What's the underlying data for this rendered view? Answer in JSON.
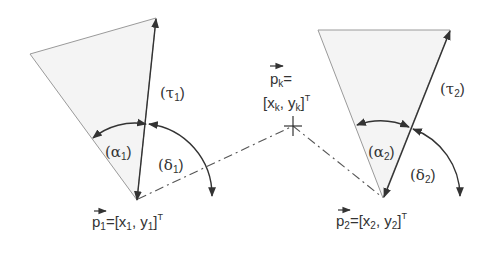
{
  "colors": {
    "stroke": "#333333",
    "fill": "#f4f4f4",
    "edge": "#9a9a9a",
    "background": "#ffffff"
  },
  "left_sensor": {
    "tau_label": "(τ",
    "tau_sub": "1",
    "alpha_label": "(α",
    "alpha_sub": "1",
    "delta_label": "(δ",
    "delta_sub": "1",
    "close_paren": ")",
    "point_label_p": "p",
    "point_sub": "1",
    "point_eq": "=[x",
    "point_x_sub": "1",
    "point_comma": ", y",
    "point_y_sub": "1",
    "point_close": "]",
    "point_sup": "T"
  },
  "right_sensor": {
    "tau_label": "(τ",
    "tau_sub": "2",
    "alpha_label": "(α",
    "alpha_sub": "2",
    "delta_label": "(δ",
    "delta_sub": "2",
    "close_paren": ")",
    "point_label_p": "p",
    "point_sub": "2",
    "point_eq": "=[x",
    "point_x_sub": "2",
    "point_comma": ", y",
    "point_y_sub": "2",
    "point_close": "]",
    "point_sup": "T"
  },
  "target": {
    "p_label": "p",
    "p_sub": "k",
    "eq": "=",
    "coord_open": "[x",
    "x_sub": "k",
    "comma": ", y",
    "y_sub": "k",
    "coord_close": "]",
    "sup": "T"
  }
}
